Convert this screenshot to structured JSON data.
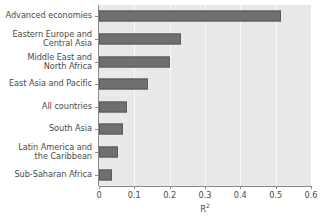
{
  "chart_data": {
    "type": "bar",
    "orientation": "horizontal",
    "title": "",
    "subtitle": "",
    "xlabel": "R²",
    "ylabel": "",
    "categories": [
      "Advanced economies",
      "Eastern Europe and\nCentral Asia",
      "Middle East and\nNorth Africa",
      "East Asia and Pacific",
      "All countries",
      "South Asia",
      "Latin America and\nthe Caribbean",
      "Sub-Saharan Africa"
    ],
    "values": [
      0.515,
      0.232,
      0.202,
      0.138,
      0.079,
      0.069,
      0.054,
      0.036
    ],
    "xlim": [
      0,
      0.6
    ],
    "xticks": [
      0,
      0.1,
      0.2,
      0.3,
      0.4,
      0.5,
      0.6
    ],
    "xtick_labels": [
      "0",
      "0.1",
      "0.2",
      "0.3",
      "0.4",
      "0.5",
      "0.6"
    ],
    "grid": "vertical",
    "legend": "none",
    "bar_color": "#6f6f6f",
    "bar_edge_color": "#5b5b5b",
    "plot_background": "#e9e9e9",
    "gridline_color": "#fbfbfb",
    "axis_color": "#8a8a8a",
    "text_color": "#4a4a4a"
  },
  "axis_title": {
    "base": "R",
    "exponent": "2"
  }
}
